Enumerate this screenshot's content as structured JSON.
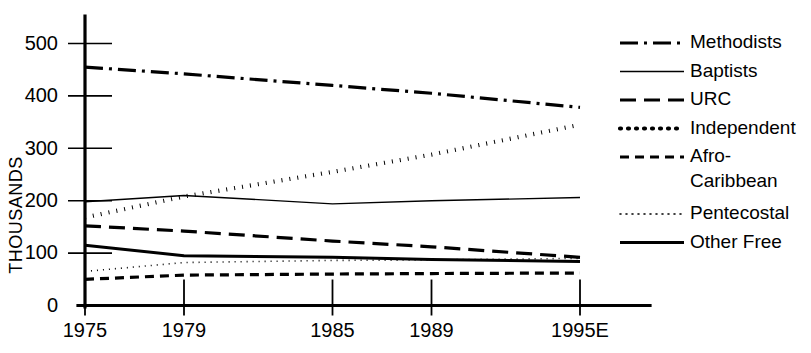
{
  "chart_data": {
    "type": "line",
    "title": "",
    "xlabel": "",
    "ylabel": "THOUSANDS",
    "x": [
      "1975",
      "1979",
      "1985",
      "1989",
      "1995E"
    ],
    "x_positions": [
      1975,
      1979,
      1985,
      1989,
      1995
    ],
    "xlim": [
      1975,
      1995
    ],
    "ylim": [
      0,
      520
    ],
    "yticks": [
      0,
      100,
      200,
      300,
      400,
      500
    ],
    "ytick_labels": [
      "0",
      "100",
      "200",
      "300",
      "400",
      "500"
    ],
    "xtick_labels": [
      "1975",
      "1979",
      "1985",
      "1989",
      "1995E"
    ],
    "grid": false,
    "legend_position": "right",
    "series": [
      {
        "name": "Methodists",
        "style": "dash-dot",
        "width": 3.2,
        "dasharray": "18 6 3 6",
        "values": [
          455,
          442,
          420,
          405,
          378
        ]
      },
      {
        "name": "Baptists",
        "style": "solid-thin",
        "width": 1.4,
        "dasharray": "none",
        "values": [
          198,
          210,
          194,
          200,
          206
        ]
      },
      {
        "name": "URC",
        "style": "long-dash",
        "width": 3.2,
        "dasharray": "16 8",
        "values": [
          152,
          142,
          123,
          112,
          92
        ]
      },
      {
        "name": "Independent",
        "style": "thick-dots",
        "width": 4.2,
        "dasharray": "1 7",
        "values": [
          168,
          208,
          255,
          288,
          345
        ]
      },
      {
        "name": "Afro-Caribbean",
        "style": "medium-dash",
        "width": 3.2,
        "dasharray": "9 6",
        "values": [
          50,
          58,
          60,
          61,
          62
        ]
      },
      {
        "name": "Pentecostal",
        "style": "fine-dots",
        "width": 1.6,
        "dasharray": "1 5",
        "values": [
          65,
          82,
          86,
          87,
          90
        ]
      },
      {
        "name": "Other Free",
        "style": "solid-thick",
        "width": 3.0,
        "dasharray": "none",
        "values": [
          115,
          95,
          92,
          88,
          84
        ]
      }
    ]
  },
  "legend": {
    "entries": [
      {
        "label": "Methodists"
      },
      {
        "label": "Baptists"
      },
      {
        "label": "URC"
      },
      {
        "label": "Independent"
      },
      {
        "label": "Afro-"
      },
      {
        "label": "Caribbean"
      },
      {
        "label": "Pentecostal"
      },
      {
        "label": "Other Free"
      }
    ]
  },
  "colors": {
    "ink": "#000000",
    "background": "#ffffff"
  }
}
